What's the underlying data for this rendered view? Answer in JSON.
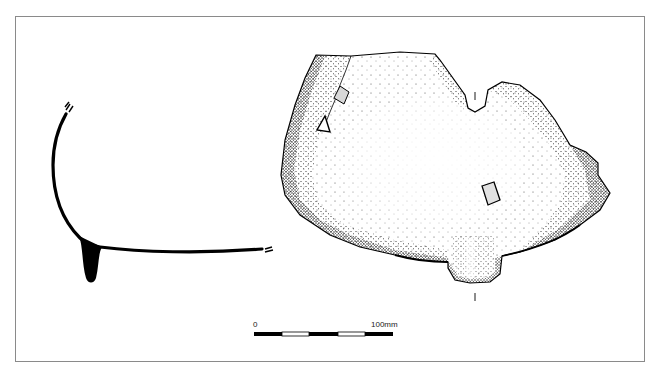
{
  "figure": {
    "frame_color": "#8a8a8a",
    "ink_color": "#000000",
    "stipple_color": "#1a1a1a"
  },
  "profile": {
    "label": "vessel-profile-section"
  },
  "sherd_drawing": {
    "label": "sherd-exterior-view",
    "tick_marks": 2,
    "holes": 3
  },
  "scale_bar": {
    "start_label": "0",
    "end_label": "100mm",
    "segments": 5
  },
  "caption": {
    "text": ""
  }
}
